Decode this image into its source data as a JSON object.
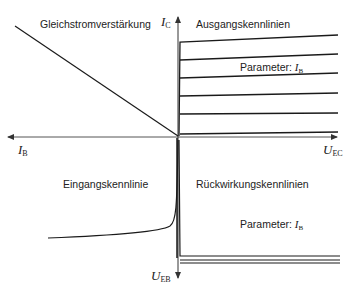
{
  "quadrants": {
    "top_left": {
      "title": "Gleichstromverstärkung"
    },
    "top_right": {
      "title": "Ausgangskennlinien",
      "parameter_label": "Parameter:",
      "parameter_symbol": "I",
      "parameter_sub": "B"
    },
    "bottom_left": {
      "title": "Eingangskennlinie"
    },
    "bottom_right": {
      "title": "Rückwirkungskennlinien",
      "parameter_label": "Parameter:",
      "parameter_symbol": "I",
      "parameter_sub": "B"
    }
  },
  "axes": {
    "up": {
      "symbol": "I",
      "sub": "C"
    },
    "left": {
      "symbol": "I",
      "sub": "B"
    },
    "right": {
      "symbol": "U",
      "sub": "EC"
    },
    "down": {
      "symbol": "U",
      "sub": "EB"
    }
  },
  "colors": {
    "line": "#1a1a1a",
    "axis": "#555555"
  }
}
